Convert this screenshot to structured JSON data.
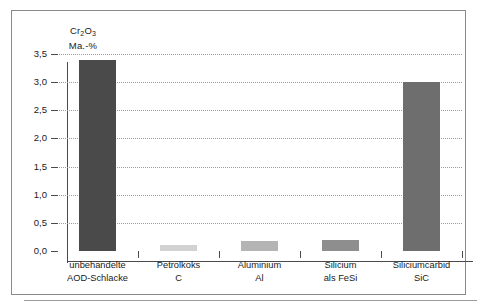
{
  "chart_data": {
    "type": "bar",
    "title": "",
    "ylabel_line1": "Cr",
    "ylabel_formula": "Cr2O3",
    "ylabel_line2": "Ma.-%",
    "xlabel": "",
    "ylim": [
      0.0,
      3.5
    ],
    "grid": true,
    "legend": "none",
    "ytick_labels": [
      "0,0",
      "0,5",
      "1,0",
      "1,5",
      "2,0",
      "2,5",
      "3,0",
      "3,5"
    ],
    "ytick_values": [
      0.0,
      0.5,
      1.0,
      1.5,
      2.0,
      2.5,
      3.0,
      3.5
    ],
    "categories": [
      "unbehandelte AOD-Schlacke",
      "Petrolkoks C",
      "Aluminium Al",
      "Silicium als FeSi",
      "Siliciumcarbid SiC"
    ],
    "category_lines": [
      [
        "unbehandelte",
        "AOD-Schlacke"
      ],
      [
        "Petrolkoks",
        "C"
      ],
      [
        "Aluminium",
        "Al"
      ],
      [
        "Silicium",
        "als FeSi"
      ],
      [
        "Siliciumcarbid",
        "SiC"
      ]
    ],
    "values": [
      3.4,
      0.1,
      0.17,
      0.2,
      3.0
    ],
    "bar_colors": [
      "#4a4a4a",
      "#d2d2d2",
      "#b4b4b4",
      "#8e8e8e",
      "#6e6e6e"
    ]
  },
  "axis": {
    "title_element": "Cr",
    "title_sub1": "2",
    "title_mid": "O",
    "title_sub2": "3",
    "title_unit": "Ma.-%"
  }
}
